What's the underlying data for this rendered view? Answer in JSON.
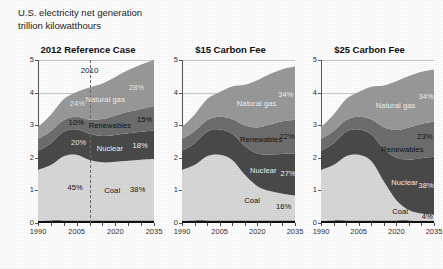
{
  "header": {
    "title": "U.S. electricity net generation",
    "subtitle": "trillion kilowatthours"
  },
  "chart_data": {
    "type": "area",
    "title": "U.S. electricity net generation",
    "ylabel": "trillion kilowatthours",
    "xlabel": "",
    "ylim": [
      0,
      5
    ],
    "xlim": [
      1990,
      2035
    ],
    "grid": true,
    "stacked": true,
    "legend_position": "inline-annotations",
    "yticks": [
      "0",
      "1",
      "2",
      "3",
      "4",
      "5"
    ],
    "xticks": [
      "1990",
      "2005",
      "2020",
      "2035"
    ],
    "series_order_bottom_to_top": [
      "Other",
      "Coal",
      "Nuclear",
      "Renewables",
      "Natural gas"
    ],
    "colors": {
      "other": "#111111",
      "coal": "#d9d9d9",
      "nuclear": "#4a4a4a",
      "renewables": "#6e6e6e",
      "natural_gas": "#9a9a9a"
    },
    "panels": [
      {
        "title": "2012 Reference Case",
        "divider_year": "2010",
        "divider_label": "2010",
        "annotations": [
          {
            "series": "Natural gas",
            "label": "Natural gas",
            "start_pct": "24%",
            "end_pct": "28%"
          },
          {
            "series": "Renewables",
            "label": "Renewables",
            "start_pct": "10%",
            "end_pct": "15%"
          },
          {
            "series": "Nuclear",
            "label": "Nuclear",
            "start_pct": "20%",
            "end_pct": "18%"
          },
          {
            "series": "Coal",
            "label": "Coal",
            "start_pct": "45%",
            "end_pct": "38%"
          }
        ],
        "x": [
          1990,
          1995,
          2000,
          2005,
          2010,
          2015,
          2020,
          2025,
          2030,
          2035
        ],
        "series": [
          {
            "name": "Other",
            "values": [
              0.07,
              0.08,
              0.08,
              0.08,
              0.08,
              0.08,
              0.08,
              0.08,
              0.08,
              0.08
            ]
          },
          {
            "name": "Coal",
            "values": [
              1.56,
              1.7,
              1.97,
              2.01,
              1.85,
              1.78,
              1.8,
              1.83,
              1.86,
              1.88
            ]
          },
          {
            "name": "Nuclear",
            "values": [
              0.58,
              0.67,
              0.75,
              0.78,
              0.81,
              0.81,
              0.82,
              0.84,
              0.86,
              0.88
            ]
          },
          {
            "name": "Renewables",
            "values": [
              0.36,
              0.37,
              0.36,
              0.39,
              0.43,
              0.52,
              0.6,
              0.66,
              0.7,
              0.75
            ]
          },
          {
            "name": "Natural gas",
            "values": [
              0.37,
              0.5,
              0.64,
              0.76,
              0.99,
              1.09,
              1.18,
              1.28,
              1.36,
              1.41
            ]
          }
        ],
        "totals": [
          2.94,
          3.32,
          3.8,
          4.02,
          4.16,
          4.28,
          4.48,
          4.69,
          4.86,
          5.0
        ]
      },
      {
        "title": "$15 Carbon Fee",
        "annotations": [
          {
            "series": "Natural gas",
            "label": "Natural gas",
            "end_pct": "34%"
          },
          {
            "series": "Renewables",
            "label": "Renewables",
            "end_pct": "22%"
          },
          {
            "series": "Nuclear",
            "label": "Nuclear",
            "end_pct": "27%"
          },
          {
            "series": "Coal",
            "label": "Coal",
            "end_pct": "16%"
          }
        ],
        "x": [
          1990,
          1995,
          2000,
          2005,
          2010,
          2015,
          2020,
          2025,
          2030,
          2035
        ],
        "series": [
          {
            "name": "Other",
            "values": [
              0.07,
              0.08,
              0.08,
              0.08,
              0.08,
              0.08,
              0.08,
              0.08,
              0.08,
              0.08
            ]
          },
          {
            "name": "Coal",
            "values": [
              1.56,
              1.7,
              1.97,
              2.01,
              1.85,
              1.4,
              1.05,
              0.9,
              0.82,
              0.76
            ]
          },
          {
            "name": "Nuclear",
            "values": [
              0.58,
              0.67,
              0.75,
              0.78,
              0.81,
              0.88,
              1.0,
              1.12,
              1.22,
              1.28
            ]
          },
          {
            "name": "Renewables",
            "values": [
              0.36,
              0.37,
              0.36,
              0.39,
              0.45,
              0.63,
              0.8,
              0.92,
              1.0,
              1.05
            ]
          },
          {
            "name": "Natural gas",
            "values": [
              0.37,
              0.5,
              0.64,
              0.76,
              1.0,
              1.25,
              1.45,
              1.55,
              1.6,
              1.63
            ]
          }
        ],
        "totals": [
          2.94,
          3.32,
          3.8,
          4.02,
          4.19,
          4.24,
          4.38,
          4.57,
          4.72,
          4.8
        ]
      },
      {
        "title": "$25 Carbon Fee",
        "annotations": [
          {
            "series": "Natural gas",
            "label": "Natural gas",
            "end_pct": "34%"
          },
          {
            "series": "Renewables",
            "label": "Renewables",
            "end_pct": "23%"
          },
          {
            "series": "Nuclear",
            "label": "Nuclear",
            "end_pct": "38%"
          },
          {
            "series": "Coal",
            "label": "Coal",
            "end_pct": "4%"
          }
        ],
        "x": [
          1990,
          1995,
          2000,
          2005,
          2010,
          2015,
          2020,
          2025,
          2030,
          2035
        ],
        "series": [
          {
            "name": "Other",
            "values": [
              0.07,
              0.08,
              0.08,
              0.08,
              0.08,
              0.08,
              0.08,
              0.08,
              0.07,
              0.07
            ]
          },
          {
            "name": "Coal",
            "values": [
              1.56,
              1.7,
              1.97,
              2.01,
              1.82,
              1.2,
              0.62,
              0.32,
              0.22,
              0.18
            ]
          },
          {
            "name": "Nuclear",
            "values": [
              0.58,
              0.67,
              0.75,
              0.78,
              0.82,
              1.0,
              1.3,
              1.55,
              1.7,
              1.78
            ]
          },
          {
            "name": "Renewables",
            "values": [
              0.36,
              0.37,
              0.36,
              0.39,
              0.46,
              0.66,
              0.85,
              0.98,
              1.05,
              1.08
            ]
          },
          {
            "name": "Natural gas",
            "values": [
              0.37,
              0.5,
              0.64,
              0.76,
              1.0,
              1.28,
              1.5,
              1.58,
              1.6,
              1.6
            ]
          }
        ],
        "totals": [
          2.94,
          3.32,
          3.8,
          4.02,
          4.18,
          4.22,
          4.35,
          4.51,
          4.64,
          4.71
        ]
      }
    ]
  }
}
